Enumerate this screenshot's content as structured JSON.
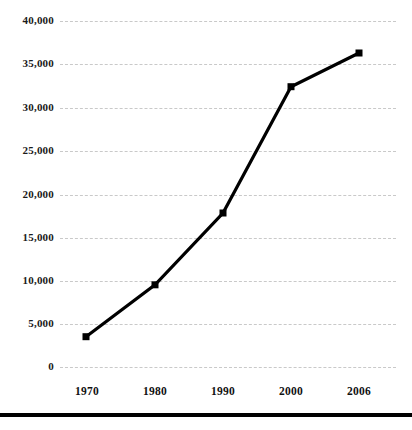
{
  "chart_data": {
    "type": "line",
    "title": "",
    "subtitle": "",
    "xlabel": "",
    "ylabel": "",
    "categories": [
      "1970",
      "1980",
      "1990",
      "2000",
      "2006"
    ],
    "values": [
      3500,
      9500,
      17800,
      32400,
      36300
    ],
    "series": [
      {
        "name": "",
        "values": [
          3500,
          9500,
          17800,
          32400,
          36300
        ]
      }
    ],
    "ylim": [
      0,
      40000
    ],
    "ytick_labels": [
      "0",
      "5,000",
      "10,000",
      "15,000",
      "20,000",
      "25,000",
      "30,000",
      "35,000",
      "40,000"
    ],
    "ytick_values": [
      0,
      5000,
      10000,
      15000,
      20000,
      25000,
      30000,
      35000,
      40000
    ],
    "xtick_labels": [
      "1970",
      "1980",
      "1990",
      "2000",
      "2006"
    ],
    "grid": true,
    "grid_style": "dashed",
    "grid_color": "#c9c9c9",
    "legend": "none",
    "line_color": "#000000",
    "marker": "square",
    "marker_color": "#000000"
  },
  "axes": {
    "y_ticks": [
      {
        "label": "40,000",
        "value": 40000
      },
      {
        "label": "35,000",
        "value": 35000
      },
      {
        "label": "30,000",
        "value": 30000
      },
      {
        "label": "25,000",
        "value": 25000
      },
      {
        "label": "20,000",
        "value": 20000
      },
      {
        "label": "15,000",
        "value": 15000
      },
      {
        "label": "10,000",
        "value": 10000
      },
      {
        "label": "5,000",
        "value": 5000
      },
      {
        "label": "0",
        "value": 0
      }
    ],
    "x_ticks": [
      {
        "label": "1970"
      },
      {
        "label": "1980"
      },
      {
        "label": "1990"
      },
      {
        "label": "2000"
      },
      {
        "label": "2006"
      }
    ]
  },
  "footer": {
    "rule_color": "#000000"
  }
}
